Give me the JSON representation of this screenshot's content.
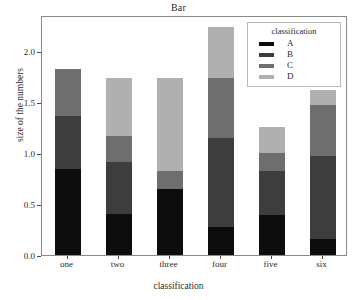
{
  "chart_data": {
    "type": "bar",
    "subtype": "stacked-bar",
    "title": "Bar",
    "xlabel": "classification",
    "ylabel": "size of the numbers",
    "categories": [
      "one",
      "two",
      "three",
      "four",
      "five",
      "six"
    ],
    "series": [
      {
        "name": "A",
        "color": "#0d0d0d",
        "values": [
          0.84,
          0.4,
          0.65,
          0.27,
          0.39,
          0.16
        ]
      },
      {
        "name": "B",
        "color": "#3d3d3d",
        "values": [
          0.52,
          0.51,
          0.0,
          0.88,
          0.43,
          0.81
        ]
      },
      {
        "name": "C",
        "color": "#6e6e6e",
        "values": [
          0.46,
          0.26,
          0.17,
          0.58,
          0.18,
          0.5
        ]
      },
      {
        "name": "D",
        "color": "#b0b0b0",
        "values": [
          0.0,
          0.56,
          0.91,
          0.5,
          0.25,
          0.15
        ]
      }
    ],
    "totals": [
      1.82,
      1.73,
      1.73,
      2.23,
      1.25,
      1.62
    ],
    "yticks": [
      0.0,
      0.5,
      1.0,
      1.5,
      2.0
    ],
    "ytick_labels": [
      "0.0",
      "0.5",
      "1.0",
      "1.5",
      "2.0"
    ],
    "ylim": [
      0.0,
      2.35
    ],
    "grid": false,
    "legend": {
      "title": "classification",
      "position": "top-right",
      "entries": [
        {
          "label": "A",
          "color": "#0d0d0d"
        },
        {
          "label": "B",
          "color": "#3d3d3d"
        },
        {
          "label": "C",
          "color": "#6e6e6e"
        },
        {
          "label": "D",
          "color": "#b0b0b0"
        }
      ]
    }
  }
}
